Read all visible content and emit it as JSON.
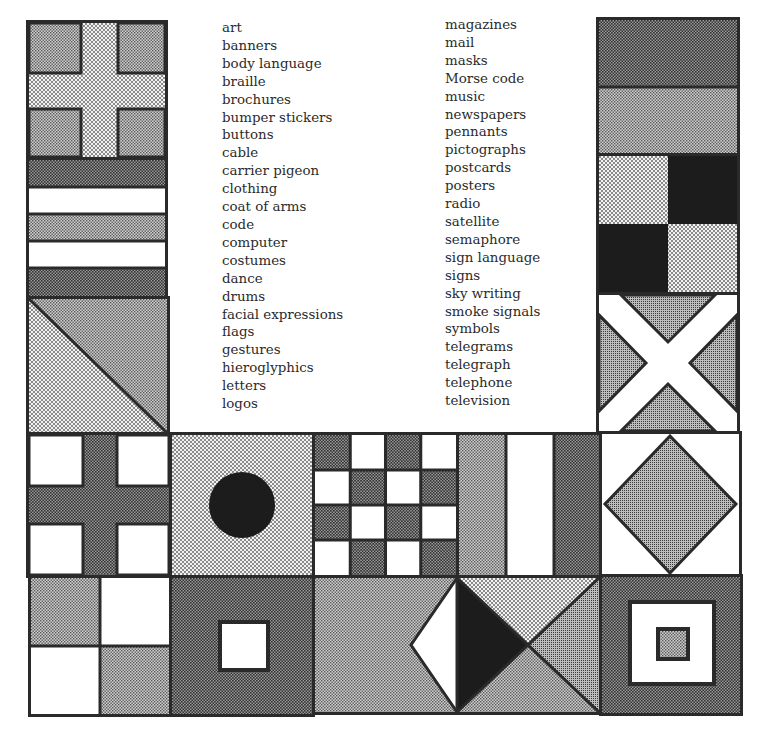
{
  "word_list": {
    "column_1": [
      "art",
      "banners",
      "body language",
      "braille",
      "brochures",
      "bumper stickers",
      "buttons",
      "cable",
      "carrier pigeon",
      "clothing",
      "coat of arms",
      "code",
      "computer",
      "costumes",
      "dance",
      "drums",
      "facial expressions",
      "flags",
      "gestures",
      "hieroglyphics",
      "letters",
      "logos"
    ],
    "column_2": [
      "magazines",
      "mail",
      "masks",
      "Morse code",
      "music",
      "newspapers",
      "pennants",
      "pictographs",
      "postcards",
      "posters",
      "radio",
      "satellite",
      "semaphore",
      "sign language",
      "signs",
      "sky writing",
      "smoke signals",
      "symbols",
      "telegrams",
      "telegraph",
      "telephone",
      "television"
    ]
  },
  "flags": [
    {
      "id": "cross-light",
      "pattern": "cross",
      "position": "left-1"
    },
    {
      "id": "horizontal-stripes",
      "pattern": "stripes",
      "position": "left-2"
    },
    {
      "id": "diagonal-split",
      "pattern": "diagonal",
      "position": "left-3"
    },
    {
      "id": "two-bands",
      "pattern": "bands",
      "position": "right-1"
    },
    {
      "id": "quartered-dark",
      "pattern": "checker-2x2",
      "position": "right-2"
    },
    {
      "id": "saltire",
      "pattern": "x-cross",
      "position": "right-3"
    },
    {
      "id": "cross-white-corners",
      "pattern": "cross",
      "position": "middle-1"
    },
    {
      "id": "disc",
      "pattern": "circle",
      "position": "middle-2"
    },
    {
      "id": "checkerboard",
      "pattern": "checker-4x4",
      "position": "middle-3"
    },
    {
      "id": "vertical-stripes",
      "pattern": "tricolor",
      "position": "middle-4"
    },
    {
      "id": "diamond",
      "pattern": "diamond",
      "position": "middle-5"
    },
    {
      "id": "quartered-light",
      "pattern": "checker-2x2",
      "position": "bottom-1"
    },
    {
      "id": "square-center",
      "pattern": "square",
      "position": "bottom-2"
    },
    {
      "id": "triangles-wide",
      "pattern": "triangles",
      "position": "bottom-3"
    },
    {
      "id": "nested-squares",
      "pattern": "nested-squares",
      "position": "bottom-4"
    }
  ],
  "colors": {
    "outline": "#2a2a2a",
    "dark": "#1c1c1c",
    "mid": "#8a8a8a",
    "light": "#b8b8b8",
    "dots": "#d6d6d6",
    "white": "#ffffff"
  }
}
